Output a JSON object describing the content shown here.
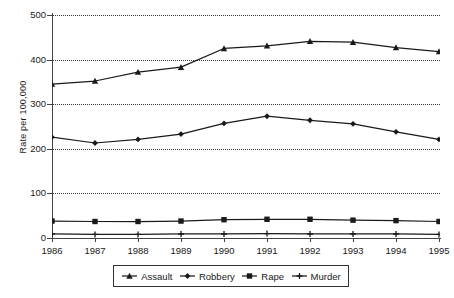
{
  "chart_data": {
    "type": "line",
    "title": "",
    "xlabel": "",
    "ylabel": "Rate per 100,000",
    "categories": [
      "1986",
      "1987",
      "1988",
      "1989",
      "1990",
      "1991",
      "1992",
      "1993",
      "1994",
      "1995"
    ],
    "x": [
      1986,
      1987,
      1988,
      1989,
      1990,
      1991,
      1992,
      1993,
      1994,
      1995
    ],
    "ylim": [
      0,
      500
    ],
    "xlim": [
      1986,
      1995
    ],
    "yticks": [
      0,
      100,
      200,
      300,
      400,
      500
    ],
    "ytick_labels": [
      "0",
      "100",
      "200",
      "300",
      "400",
      "500"
    ],
    "xtick_labels": [
      "1986",
      "1987",
      "1988",
      "1989",
      "1990",
      "1991",
      "1992",
      "1993",
      "1994",
      "1995"
    ],
    "grid": "horizontal-dotted",
    "legend_position": "bottom-center",
    "series": [
      {
        "name": "Assault",
        "marker": "triangle",
        "color": "#1a1a1a",
        "values": [
          345,
          352,
          372,
          383,
          425,
          431,
          441,
          439,
          427,
          418
        ]
      },
      {
        "name": "Robbery",
        "marker": "diamond",
        "color": "#1a1a1a",
        "values": [
          226,
          213,
          221,
          233,
          257,
          273,
          264,
          256,
          238,
          221
        ]
      },
      {
        "name": "Rape",
        "marker": "square",
        "color": "#1a1a1a",
        "values": [
          38,
          37,
          37,
          38,
          41,
          42,
          42,
          40,
          39,
          37
        ]
      },
      {
        "name": "Murder",
        "marker": "plus",
        "color": "#1a1a1a",
        "values": [
          9,
          8,
          8,
          9,
          9,
          10,
          9,
          9,
          9,
          8
        ]
      }
    ]
  },
  "legend": {
    "items": [
      {
        "label": "Assault"
      },
      {
        "label": "Robbery"
      },
      {
        "label": "Rape"
      },
      {
        "label": "Murder"
      }
    ]
  }
}
